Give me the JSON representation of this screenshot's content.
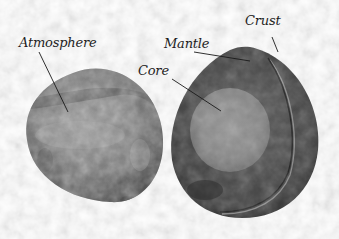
{
  "diagram": {
    "labels": {
      "atmosphere": "Atmosphere",
      "mantle": "Mantle",
      "core": "Core",
      "crust": "Crust"
    },
    "objects": [
      {
        "name": "whole-planet",
        "description": "Intact egg-shaped planet showing atmosphere surface"
      },
      {
        "name": "cutaway-planet",
        "description": "Half-sphere cut open showing core, mantle and crust"
      }
    ],
    "colors": {
      "background": "#ffffff",
      "label_text": "#1e1e1e",
      "leader_line": "#1a1a1a",
      "surface_light": "#8c8c8c",
      "surface_dark": "#4a4a4a",
      "mantle": "#4e4e4e",
      "core": "#8a8a8a",
      "crust_edge": "#2a2a2a"
    }
  }
}
